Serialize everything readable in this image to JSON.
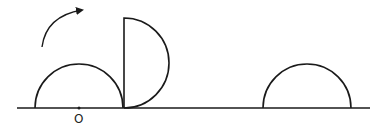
{
  "diagram": {
    "labels": {
      "origin": "O"
    },
    "stroke_color": "#1a1a1a",
    "elements": [
      {
        "name": "ground-line",
        "x1": 17,
        "x2": 370,
        "y": 108
      },
      {
        "name": "semicircle-initial",
        "center_x": 79,
        "radius": 44,
        "orientation": "up"
      },
      {
        "name": "semicircle-rotated",
        "pivot_x": 124,
        "radius": 45,
        "orientation": "right"
      },
      {
        "name": "semicircle-final",
        "center_x": 307,
        "radius": 44,
        "orientation": "up"
      },
      {
        "name": "rotation-arrow",
        "direction": "clockwise"
      }
    ]
  }
}
